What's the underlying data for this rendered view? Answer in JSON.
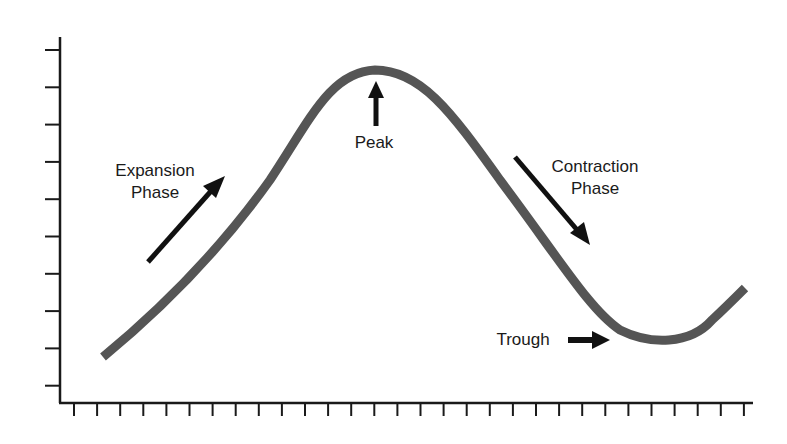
{
  "diagram": {
    "labels": {
      "expansion_line1": "Expansion",
      "expansion_line2": "Phase",
      "peak": "Peak",
      "contraction_line1": "Contraction",
      "contraction_line2": "Phase",
      "trough": "Trough"
    },
    "axes": {
      "y_ticks": 10,
      "x_ticks": 30
    },
    "colors": {
      "curve": "#555555",
      "arrow": "#111111",
      "axis": "#1a1a1a"
    }
  }
}
